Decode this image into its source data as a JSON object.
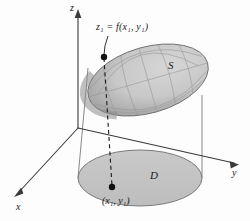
{
  "figure": {
    "background_color": "#fdfdfd",
    "axes": {
      "z_label": "z",
      "y_label": "y",
      "x_label": "x",
      "origin": [
        78,
        128
      ],
      "z_tip": [
        78,
        12
      ],
      "y_tip": [
        236,
        163
      ],
      "x_tip": [
        17,
        194
      ],
      "axis_color": "#3a3a3a"
    },
    "labels": {
      "equation": "z₁ = f(x₁, y₁)",
      "equation_parts": {
        "z": "z",
        "z_sub": "1",
        "eq": " = ",
        "f": "f(",
        "x": "x",
        "x_sub": "1",
        "comma": ", ",
        "y": "y",
        "y_sub": "1",
        "close": ")"
      },
      "point": "(x₁, y₁)",
      "surface": "S",
      "domain": "D"
    },
    "surface": {
      "name": "S",
      "fill_color": "#c9c9c9",
      "edge_shadow_color": "#8d8d8d",
      "mesh_color": "#9a9a9a",
      "stroke_color": "#6e6e6e",
      "center": [
        148,
        80
      ],
      "rx": 62,
      "ry": 33,
      "rotation_deg": -16
    },
    "domain_region": {
      "name": "D",
      "fill_color": "#c4c4c4",
      "stroke_color": "#6e6e6e",
      "center": [
        140,
        178
      ],
      "rx": 62,
      "ry": 28
    },
    "marked_points": {
      "surface_point": [
        104,
        57
      ],
      "domain_point": [
        112,
        187
      ],
      "dot_color": "#111111",
      "dot_radius": 3
    },
    "connectors": {
      "dashed_projection_color": "#1a1a1a",
      "cylinder_line_color": "#5a5a5a",
      "leader_line_color": "#1a1a1a"
    }
  }
}
